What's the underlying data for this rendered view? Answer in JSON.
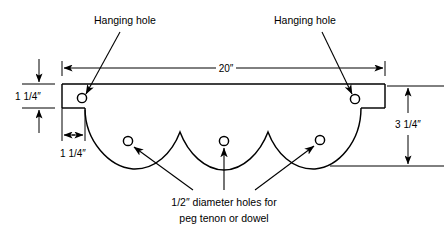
{
  "drawing": {
    "title": "Shelf board with scalloped bottom edge and peg holes",
    "stroke_color": "#000000",
    "background_color": "#ffffff",
    "labels": {
      "hanging_hole_left": "Hanging hole",
      "hanging_hole_right": "Hanging  hole",
      "peg_holes_line1": "1/2″ diameter holes for",
      "peg_holes_line2": "peg tenon or dowel"
    },
    "dimensions": {
      "overall_width": "20″",
      "board_thickness": "1 1/4″",
      "notch_width": "1 1/4″",
      "overall_height": "3 1/4″"
    },
    "features": {
      "hanging_holes": [
        {
          "name": "hanging-hole-left",
          "cx": 82,
          "cy": 98,
          "r": 4.6
        },
        {
          "name": "hanging-hole-right",
          "cx": 355,
          "cy": 99,
          "r": 4.6
        }
      ],
      "peg_holes": [
        {
          "name": "peg-hole-left",
          "cx": 128,
          "cy": 141,
          "r": 4.6
        },
        {
          "name": "peg-hole-center",
          "cx": 224,
          "cy": 141,
          "r": 4.6
        },
        {
          "name": "peg-hole-right",
          "cx": 320,
          "cy": 140,
          "r": 4.6
        }
      ]
    }
  }
}
